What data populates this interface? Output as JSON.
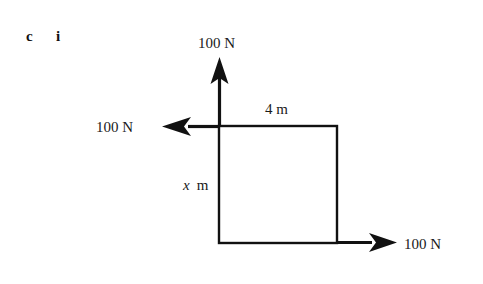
{
  "figure": {
    "part_letter": "c",
    "part_roman": "i",
    "background_color": "#ffffff",
    "stroke_color": "#111111"
  },
  "diagram": {
    "type": "force-diagram",
    "shape": {
      "name": "rectangle",
      "left": 219,
      "top": 126,
      "right": 337,
      "bottom": 243
    },
    "dimensions": [
      {
        "name": "top-edge-length",
        "label": "4 m",
        "value": 4,
        "unit": "m",
        "position": "top",
        "x": 265,
        "y": 114
      },
      {
        "name": "left-edge-length",
        "label_var": "x",
        "label_unit": "m",
        "unit": "m",
        "position": "left",
        "x": 183,
        "y": 190
      }
    ],
    "forces": [
      {
        "name": "force-up",
        "label": "100 N",
        "magnitude": 100,
        "unit": "N",
        "direction": "up",
        "applied_at": "top-left-corner",
        "label_x": 198,
        "label_y": 48
      },
      {
        "name": "force-left",
        "label": "100 N",
        "magnitude": 100,
        "unit": "N",
        "direction": "left",
        "applied_at": "top-left-corner",
        "label_x": 96,
        "label_y": 132
      },
      {
        "name": "force-right",
        "label": "100 N",
        "magnitude": 100,
        "unit": "N",
        "direction": "right",
        "applied_at": "bottom-right-corner",
        "label_x": 404,
        "label_y": 249
      }
    ]
  }
}
